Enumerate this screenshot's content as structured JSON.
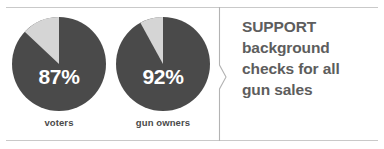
{
  "colors": {
    "slice_major": "#4a4a4a",
    "slice_minor": "#d5d5d5",
    "rule": "#c9c9c9",
    "divider": "#b3b3b3",
    "caption_text": "#4a4a4a",
    "value_text": "#ffffff",
    "statement_text": "#5d5d5d",
    "background": "#ffffff"
  },
  "chart_data": {
    "type": "pie",
    "title": "",
    "subtitle": "",
    "legend_position": "none",
    "grid": false,
    "charts": [
      {
        "label": "voters",
        "value_label": "87%",
        "slices": [
          {
            "name": "support",
            "value": 87
          },
          {
            "name": "other",
            "value": 13
          }
        ]
      },
      {
        "label": "gun owners",
        "value_label": "92%",
        "slices": [
          {
            "name": "support",
            "value": 92
          },
          {
            "name": "other",
            "value": 8
          }
        ]
      }
    ],
    "annotation": "SUPPORT background checks for all gun sales"
  },
  "statement": {
    "lines": [
      "SUPPORT",
      "background",
      "checks for all",
      "gun sales"
    ]
  },
  "divider": {
    "icon": "chevron-right-icon"
  }
}
